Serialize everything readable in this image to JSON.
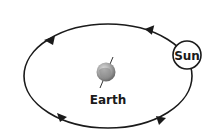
{
  "diagram": {
    "labels": {
      "sun": "Sun",
      "earth": "Earth"
    },
    "orbit": {
      "shape": "ellipse",
      "direction": "counterclockwise (arrows along top point left, along bottom point right)",
      "arrow_count": 4
    },
    "colors": {
      "line": "#1a1a1a",
      "earth_fill": "#9a9a9a",
      "background": "#ffffff"
    }
  }
}
